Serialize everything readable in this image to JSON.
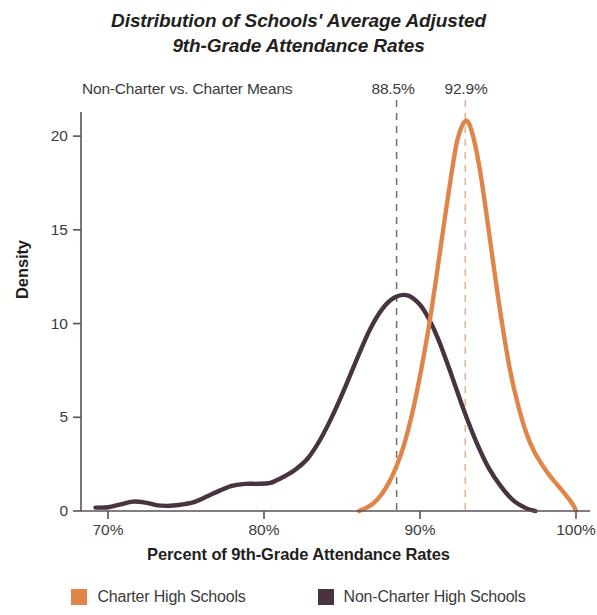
{
  "chart_data": {
    "type": "line",
    "title": "Distribution of Schools' Average Adjusted 9th-Grade Attendance Rates",
    "title_line1": "Distribution of Schools' Average Adjusted",
    "title_line2": "9th-Grade Attendance Rates",
    "xlabel": "Percent of 9th-Grade Attendance Rates",
    "ylabel": "Density",
    "xlim": [
      69,
      101
    ],
    "ylim": [
      0,
      21.5
    ],
    "grid": false,
    "legend_position": "bottom",
    "xticks": [
      70,
      80,
      90,
      100
    ],
    "xtick_labels": [
      "70%",
      "80%",
      "90%",
      "100%"
    ],
    "yticks": [
      0,
      5,
      10,
      15,
      20
    ],
    "ytick_labels": [
      "0",
      "5",
      "10",
      "15",
      "20"
    ],
    "annotation": "Non-Charter vs. Charter Means",
    "annotations": [
      {
        "label": "88.5%",
        "x": 88.5,
        "series": "Non-Charter High Schools",
        "color": "#6f6f6f",
        "style": "dashed"
      },
      {
        "label": "92.9%",
        "x": 92.9,
        "series": "Charter High Schools",
        "color": "#e9b48d",
        "style": "dashed"
      }
    ],
    "series": [
      {
        "name": "Charter High Schools",
        "color": "#e0854a",
        "x": [
          86.1,
          86.5,
          87.0,
          87.5,
          88.0,
          88.5,
          89.0,
          89.5,
          90.0,
          90.5,
          91.0,
          91.5,
          92.0,
          92.4,
          92.9,
          93.3,
          93.8,
          94.3,
          94.8,
          95.3,
          95.8,
          96.3,
          96.8,
          97.3,
          97.8,
          98.3,
          98.8,
          99.3,
          99.8,
          100.0
        ],
        "y": [
          0.0,
          0.15,
          0.4,
          0.85,
          1.5,
          2.4,
          3.6,
          5.2,
          7.2,
          9.5,
          12.2,
          15.1,
          17.9,
          19.8,
          20.8,
          20.3,
          18.4,
          15.6,
          12.6,
          9.8,
          7.4,
          5.6,
          4.2,
          3.2,
          2.5,
          1.9,
          1.4,
          0.9,
          0.35,
          0.0
        ]
      },
      {
        "name": "Non-Charter High Schools",
        "color": "#473440",
        "x": [
          69.2,
          70.0,
          70.8,
          71.6,
          72.4,
          73.2,
          74.0,
          74.8,
          75.6,
          76.4,
          77.2,
          78.0,
          78.8,
          79.6,
          80.4,
          81.2,
          82.0,
          82.8,
          83.6,
          84.4,
          85.2,
          86.0,
          86.8,
          87.6,
          88.4,
          89.2,
          90.0,
          90.6,
          91.2,
          92.0,
          92.8,
          93.6,
          94.4,
          95.2,
          96.0,
          96.8,
          97.4
        ],
        "y": [
          0.18,
          0.2,
          0.35,
          0.5,
          0.45,
          0.3,
          0.28,
          0.35,
          0.5,
          0.8,
          1.1,
          1.35,
          1.45,
          1.45,
          1.5,
          1.8,
          2.2,
          2.8,
          3.8,
          5.1,
          6.6,
          8.2,
          9.7,
          10.8,
          11.4,
          11.5,
          11.0,
          10.2,
          9.1,
          7.3,
          5.4,
          3.7,
          2.3,
          1.3,
          0.55,
          0.15,
          0.0
        ]
      }
    ]
  },
  "legend": {
    "items": [
      {
        "label": "Charter High Schools",
        "color": "#e0854a"
      },
      {
        "label": "Non-Charter High Schools",
        "color": "#473440"
      }
    ]
  }
}
